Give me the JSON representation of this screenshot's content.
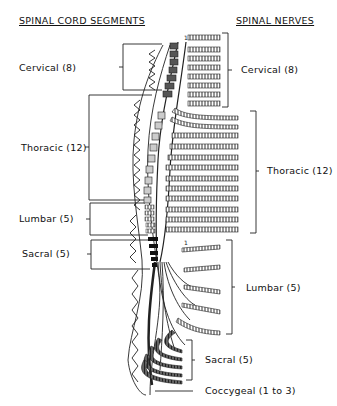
{
  "headers": {
    "left": "SPINAL CORD SEGMENTS",
    "right": "SPINAL NERVES"
  },
  "left_labels": [
    {
      "label": "Cervical (8)"
    },
    {
      "label": "Thoracic (12)"
    },
    {
      "label": "Lumbar (5)"
    },
    {
      "label": "Sacral (5)"
    }
  ],
  "right_labels": [
    {
      "label": "Cervical (8)"
    },
    {
      "label": "Thoracic (12)"
    },
    {
      "label": "Lumbar (5)"
    },
    {
      "label": "Sacral (5)"
    },
    {
      "label": "Coccygeal (1 to 3)"
    }
  ],
  "markers": {
    "t1": "1",
    "l1": "1"
  }
}
